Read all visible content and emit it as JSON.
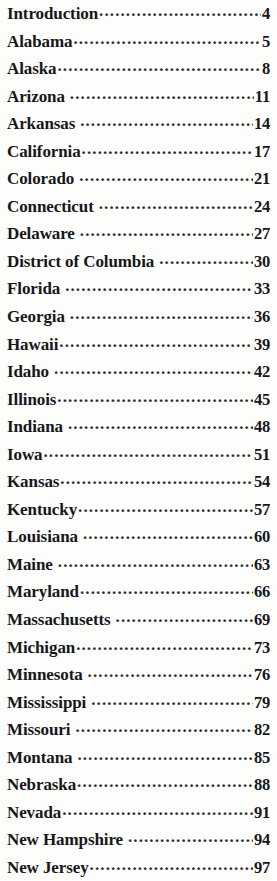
{
  "document": {
    "type": "table-of-contents",
    "text_color": "#17171a",
    "background_color": "#fdfdfb",
    "entries": [
      {
        "title": "Introduction",
        "page": "4",
        "gap": false
      },
      {
        "title": "Alabama",
        "page": "5",
        "gap": false
      },
      {
        "title": "Alaska",
        "page": "8",
        "gap": false
      },
      {
        "title": "Arizona",
        "page": "11",
        "gap": true
      },
      {
        "title": "Arkansas",
        "page": "14",
        "gap": true
      },
      {
        "title": "California",
        "page": "17",
        "gap": false
      },
      {
        "title": "Colorado",
        "page": "21",
        "gap": true
      },
      {
        "title": "Connecticut",
        "page": "24",
        "gap": true
      },
      {
        "title": "Delaware",
        "page": "27",
        "gap": true
      },
      {
        "title": "District of Columbia",
        "page": "30",
        "gap": true
      },
      {
        "title": "Florida",
        "page": "33",
        "gap": true
      },
      {
        "title": "Georgia",
        "page": "36",
        "gap": true
      },
      {
        "title": "Hawaii",
        "page": "39",
        "gap": false
      },
      {
        "title": "Idaho",
        "page": "42",
        "gap": true
      },
      {
        "title": "Illinois",
        "page": "45",
        "gap": false
      },
      {
        "title": "Indiana",
        "page": "48",
        "gap": true
      },
      {
        "title": "Iowa",
        "page": "51",
        "gap": false
      },
      {
        "title": "Kansas",
        "page": "54",
        "gap": false
      },
      {
        "title": "Kentucky",
        "page": "57",
        "gap": false
      },
      {
        "title": "Louisiana",
        "page": "60",
        "gap": true
      },
      {
        "title": "Maine",
        "page": "63",
        "gap": true
      },
      {
        "title": "Maryland",
        "page": "66",
        "gap": false
      },
      {
        "title": "Massachusetts",
        "page": "69",
        "gap": true
      },
      {
        "title": "Michigan",
        "page": "73",
        "gap": false
      },
      {
        "title": "Minnesota",
        "page": "76",
        "gap": true
      },
      {
        "title": "Mississippi",
        "page": "79",
        "gap": true
      },
      {
        "title": "Missouri",
        "page": "82",
        "gap": true
      },
      {
        "title": "Montana",
        "page": "85",
        "gap": true
      },
      {
        "title": "Nebraska",
        "page": "88",
        "gap": false
      },
      {
        "title": "Nevada",
        "page": "91",
        "gap": false
      },
      {
        "title": "New Hampshire",
        "page": "94",
        "gap": true
      },
      {
        "title": "New Jersey",
        "page": "97",
        "gap": false
      }
    ]
  }
}
